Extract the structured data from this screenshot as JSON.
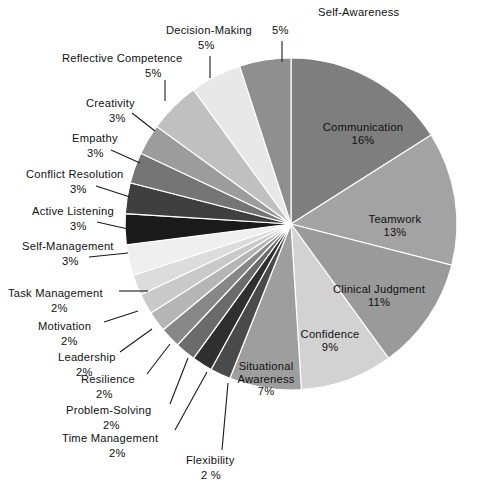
{
  "chart_data": {
    "type": "pie",
    "title": "",
    "subtitle": "",
    "xlabel": "",
    "ylabel": "",
    "legend_position": "none",
    "grid": false,
    "units": "percent",
    "start_angle_deg": 0,
    "direction": "clockwise",
    "categories": [
      "Communication",
      "Teamwork",
      "Clinical Judgment",
      "Confidence",
      "Situational Awareness",
      "Flexibility",
      "Time Management",
      "Problem-Solving",
      "Resilience",
      "Leadership",
      "Motivation",
      "Task Management",
      "Self-Management",
      "Active Listening",
      "Conflict Resolution",
      "Empathy",
      "Creativity",
      "Reflective Competence",
      "Decision-Making",
      "Self-Awareness"
    ],
    "values": [
      16,
      13,
      11,
      9,
      7,
      2,
      2,
      2,
      2,
      2,
      2,
      2,
      3,
      3,
      3,
      3,
      3,
      5,
      5,
      5
    ],
    "value_labels": [
      "16%",
      "13%",
      "11%",
      "9%",
      "7%",
      "2 %",
      "2%",
      "2%",
      "2%",
      "2%",
      "2%",
      "2%",
      "3%",
      "3%",
      "3%",
      "3%",
      "3%",
      "5%",
      "5%",
      "5%"
    ],
    "colors": [
      "#7e7e7e",
      "#a3a3a3",
      "#9a9a9a",
      "#d2d2d2",
      "#9e9e9e",
      "#4a4a4a",
      "#2f2f2f",
      "#6b6b6b",
      "#878787",
      "#b5b5b5",
      "#c9c9c9",
      "#dcdcdc",
      "#efefef",
      "#1a1a1a",
      "#3f3f3f",
      "#757575",
      "#9c9c9c",
      "#c0c0c0",
      "#e8e8e8",
      "#8f8f8f"
    ],
    "slice_labels_inside": [
      {
        "name": "Communication",
        "pct": "16%",
        "x": 363,
        "y": 121
      },
      {
        "name": "Teamwork",
        "pct": "13%",
        "x": 395,
        "y": 213
      },
      {
        "name": "Clinical Judgment",
        "pct": "11%",
        "x": 379,
        "y": 283
      },
      {
        "name": "Confidence",
        "pct": "9%",
        "x": 330,
        "y": 328
      },
      {
        "name": "Situational Awareness",
        "pct": "7%",
        "x": 266,
        "y": 360
      }
    ],
    "slice_labels_outside": [
      {
        "name": "Self-Awareness",
        "pct": "5%"
      },
      {
        "name": "Decision-Making",
        "pct": "5%"
      },
      {
        "name": "Reflective Competence",
        "pct": "5%"
      },
      {
        "name": "Creativity",
        "pct": "3%"
      },
      {
        "name": "Empathy",
        "pct": "3%"
      },
      {
        "name": "Conflict Resolution",
        "pct": "3%"
      },
      {
        "name": "Active Listening",
        "pct": "3%"
      },
      {
        "name": "Self-Management",
        "pct": "3%"
      },
      {
        "name": "Task Management",
        "pct": "2%"
      },
      {
        "name": "Motivation",
        "pct": "2%"
      },
      {
        "name": "Leadership",
        "pct": "2%"
      },
      {
        "name": "Resilience",
        "pct": "2%"
      },
      {
        "name": "Problem-Solving",
        "pct": "2%"
      },
      {
        "name": "Time Management",
        "pct": "2%"
      },
      {
        "name": "Flexibility",
        "pct": "2 %"
      }
    ]
  },
  "geometry": {
    "center_x": 291,
    "center_y": 224,
    "radius": 166,
    "separator_color": "#ffffff",
    "separator_width": 1.2,
    "background": "#ffffff",
    "leader_color": "#1a1a1a"
  },
  "labels_outside_layout": [
    {
      "key": "self-awareness",
      "text_x": 318,
      "text_y": 6,
      "align": "left",
      "name_only": true,
      "pct_x": 272,
      "pct_y": 24,
      "leader": [
        [
          282,
          41
        ],
        [
          282,
          62
        ]
      ]
    },
    {
      "key": "decision-making",
      "text_x": 166,
      "text_y": 24,
      "align": "left",
      "name_only": true,
      "pct_x": 198,
      "pct_y": 39,
      "leader": [
        [
          210,
          56
        ],
        [
          210,
          78
        ]
      ]
    },
    {
      "key": "reflective-competence",
      "text_x": 62,
      "text_y": 52,
      "align": "left",
      "name_only": true,
      "pct_x": 145,
      "pct_y": 67,
      "leader": [
        [
          165,
          80
        ],
        [
          165,
          101
        ]
      ]
    },
    {
      "key": "creativity",
      "text_x": 86,
      "text_y": 97,
      "align": "left",
      "name_only": true,
      "pct_x": 109,
      "pct_y": 112,
      "leader": [
        [
          132,
          113
        ],
        [
          155,
          131
        ]
      ]
    },
    {
      "key": "empathy",
      "text_x": 72,
      "text_y": 132,
      "align": "left",
      "name_only": true,
      "pct_x": 87,
      "pct_y": 147,
      "leader": [
        [
          111,
          150
        ],
        [
          140,
          163
        ]
      ]
    },
    {
      "key": "conflict-resolution",
      "text_x": 26,
      "text_y": 168,
      "align": "left",
      "name_only": true,
      "pct_x": 70,
      "pct_y": 183,
      "leader": [
        [
          96,
          186
        ],
        [
          130,
          197
        ]
      ]
    },
    {
      "key": "active-listening",
      "text_x": 32,
      "text_y": 205,
      "align": "left",
      "name_only": true,
      "pct_x": 70,
      "pct_y": 220,
      "leader": [
        [
          97,
          222
        ],
        [
          128,
          229
        ]
      ]
    },
    {
      "key": "self-management",
      "text_x": 22,
      "text_y": 240,
      "align": "left",
      "name_only": true,
      "pct_x": 62,
      "pct_y": 255,
      "leader": [
        [
          89,
          257
        ],
        [
          128,
          253
        ]
      ]
    },
    {
      "key": "task-management",
      "text_x": 8,
      "text_y": 287,
      "align": "left",
      "name_only": true,
      "pct_x": 51,
      "pct_y": 302,
      "leader": [
        [
          119,
          291
        ],
        [
          148,
          291
        ]
      ]
    },
    {
      "key": "motivation",
      "text_x": 38,
      "text_y": 320,
      "align": "left",
      "name_only": true,
      "pct_x": 61,
      "pct_y": 335,
      "leader": [
        [
          104,
          322
        ],
        [
          138,
          311
        ]
      ]
    },
    {
      "key": "leadership",
      "text_x": 58,
      "text_y": 351,
      "align": "left",
      "name_only": true,
      "pct_x": 76,
      "pct_y": 366,
      "leader": [
        [
          120,
          352
        ],
        [
          152,
          329
        ]
      ]
    },
    {
      "key": "resilience",
      "text_x": 81,
      "text_y": 373,
      "align": "left",
      "name_only": true,
      "pct_x": 96,
      "pct_y": 388,
      "leader": [
        [
          147,
          374
        ],
        [
          170,
          344
        ]
      ]
    },
    {
      "key": "problem-solving",
      "text_x": 66,
      "text_y": 404,
      "align": "left",
      "name_only": true,
      "pct_x": 103,
      "pct_y": 419,
      "leader": [
        [
          170,
          404
        ],
        [
          188,
          358
        ]
      ]
    },
    {
      "key": "time-management",
      "text_x": 62,
      "text_y": 432,
      "align": "left",
      "name_only": true,
      "pct_x": 109,
      "pct_y": 447,
      "leader": [
        [
          175,
          430
        ],
        [
          207,
          372
        ]
      ]
    },
    {
      "key": "flexibility",
      "text_x": 186,
      "text_y": 454,
      "align": "left",
      "name_only": true,
      "pct_x": 201,
      "pct_y": 469,
      "leader": [
        [
          222,
          450
        ],
        [
          228,
          383
        ]
      ]
    }
  ]
}
